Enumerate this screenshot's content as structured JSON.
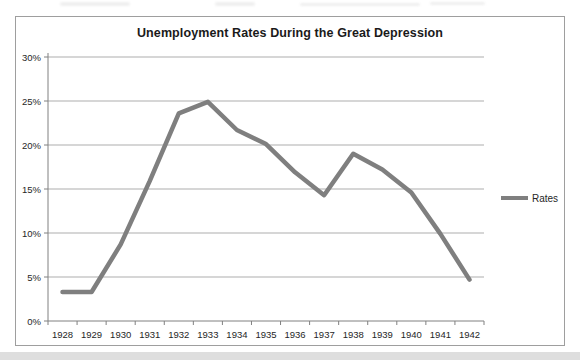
{
  "chart_data": {
    "type": "line",
    "title": "Unemployment Rates During the Great Depression",
    "x": [
      "1928",
      "1929",
      "1930",
      "1931",
      "1932",
      "1933",
      "1934",
      "1935",
      "1936",
      "1937",
      "1938",
      "1939",
      "1940",
      "1941",
      "1942"
    ],
    "series": [
      {
        "name": "Rates",
        "color": "#7f7f7f",
        "values": [
          3.3,
          3.3,
          8.7,
          15.9,
          23.6,
          24.9,
          21.7,
          20.1,
          16.9,
          14.3,
          19.0,
          17.2,
          14.6,
          9.9,
          4.7
        ]
      }
    ],
    "xlabel": "",
    "ylabel": "",
    "ylim": [
      0,
      30
    ],
    "ytick_values": [
      0,
      5,
      10,
      15,
      20,
      25,
      30
    ],
    "ytick_labels": [
      "0%",
      "5%",
      "10%",
      "15%",
      "20%",
      "25%",
      "30%"
    ],
    "grid": true,
    "legend_position": "right"
  },
  "styles": {
    "grid_color": "#adadad",
    "axis_color": "#808080",
    "tick_color": "#808080",
    "text_color": "#262626",
    "border_color": "#9e9e9e",
    "line_color": "#7f7f7f",
    "background": "#ffffff"
  }
}
